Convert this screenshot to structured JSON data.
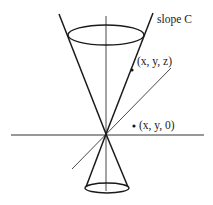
{
  "diagram": {
    "type": "double-cone",
    "colors": {
      "stroke": "#1a1a1a",
      "background": "#ffffff",
      "thin_stroke": "#333333"
    },
    "labels": {
      "slope": "slope C",
      "point_on_cone": "(x, y, z)",
      "point_in_plane": "(x, y, 0)"
    },
    "elements": {
      "apex": [
        106,
        134
      ],
      "vertical_axis": {
        "x": 106,
        "y1": 16,
        "y2": 191
      },
      "horizontal_axis": {
        "y": 135,
        "x1": 11,
        "x2": 204
      },
      "diagonal_axis": {
        "x1": 72,
        "y1": 169,
        "x2": 171,
        "y2": 68
      },
      "upper_cone": {
        "left_line": [
          [
            59,
            14
          ],
          [
            106,
            134
          ]
        ],
        "right_line": [
          [
            153,
            13
          ],
          [
            106,
            134
          ]
        ],
        "rim_ellipse": {
          "cx": 106,
          "cy": 35,
          "rx": 38,
          "ry": 10
        }
      },
      "lower_cone": {
        "left_line": [
          [
            106,
            134
          ],
          [
            86,
            187
          ]
        ],
        "right_line": [
          [
            106,
            134
          ],
          [
            128,
            187
          ]
        ],
        "rim_ellipse": {
          "cx": 107,
          "cy": 188,
          "rx": 22,
          "ry": 5
        }
      },
      "points": [
        {
          "name": "point-on-cone",
          "at": [
            132,
            70
          ]
        },
        {
          "name": "point-in-plane",
          "at": [
            134,
            126
          ]
        }
      ]
    }
  }
}
